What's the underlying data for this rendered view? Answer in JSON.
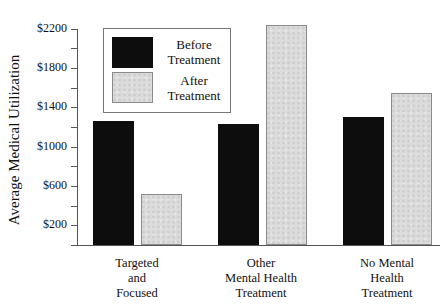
{
  "chart_data": {
    "type": "bar",
    "title": "",
    "xlabel": "",
    "ylabel": "Average Medical Utilization",
    "categories": [
      "Targeted and Focused",
      "Other Mental Health Treatment",
      "No Mental Health Treatment"
    ],
    "category_label_lines": [
      [
        "Targeted",
        "and",
        "Focused"
      ],
      [
        "Other",
        "Mental Health",
        "Treatment"
      ],
      [
        "No Mental",
        "Health",
        "Treatment"
      ]
    ],
    "series": [
      {
        "name": "Before Treatment",
        "color": "#0d0d0d",
        "values": [
          1260,
          1230,
          1300
        ]
      },
      {
        "name": "After Treatment",
        "color": "#dcdcdc",
        "values": [
          520,
          2240,
          1550
        ]
      }
    ],
    "ylim": [
      0,
      2200
    ],
    "yticks": [
      200,
      600,
      1000,
      1400,
      1800,
      2200
    ],
    "ytick_labels": [
      "$200",
      "$600",
      "$1000",
      "$1400",
      "$1800",
      "$2200"
    ],
    "grid": false,
    "legend_position": "upper-left (inside plot)"
  },
  "legend": {
    "before": {
      "line1": "Before",
      "line2": "Treatment"
    },
    "after": {
      "line1": "After",
      "line2": "Treatment"
    }
  }
}
